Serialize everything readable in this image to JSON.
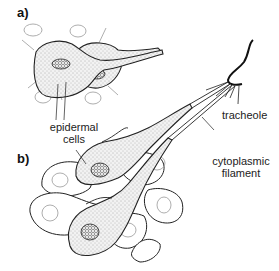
{
  "figure": {
    "panels": [
      {
        "id": "a",
        "label": "a)"
      },
      {
        "id": "b",
        "label": "b)"
      }
    ],
    "labels": {
      "epidermal_cells": "epidermal\ncells",
      "tracheole": "tracheole",
      "cytoplasmic_filament": "cytoplasmic\nfilament"
    },
    "colors": {
      "stroke": "#222222",
      "stipple_fill": "#e6e6e6",
      "faint_outline": "#999999",
      "background": "#ffffff"
    }
  }
}
